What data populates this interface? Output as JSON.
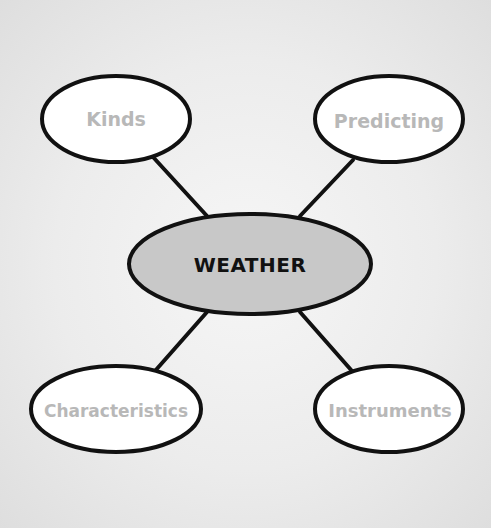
{
  "diagram": {
    "type": "concept-web",
    "center": {
      "label": "WEATHER",
      "fill": "#c8c8c8"
    },
    "nodes": [
      {
        "id": "kinds",
        "label": "Kinds",
        "fill": "#ffffff",
        "text_color": "#b8b8b8"
      },
      {
        "id": "predicting",
        "label": "Predicting",
        "fill": "#ffffff",
        "text_color": "#b8b8b8"
      },
      {
        "id": "characteristics",
        "label": "Characteristics",
        "fill": "#ffffff",
        "text_color": "#b8b8b8"
      },
      {
        "id": "instruments",
        "label": "Instruments",
        "fill": "#ffffff",
        "text_color": "#b8b8b8"
      }
    ],
    "edges": [
      {
        "from": "weather",
        "to": "kinds"
      },
      {
        "from": "weather",
        "to": "predicting"
      },
      {
        "from": "weather",
        "to": "characteristics"
      },
      {
        "from": "weather",
        "to": "instruments"
      }
    ],
    "line_color": "#111111"
  }
}
